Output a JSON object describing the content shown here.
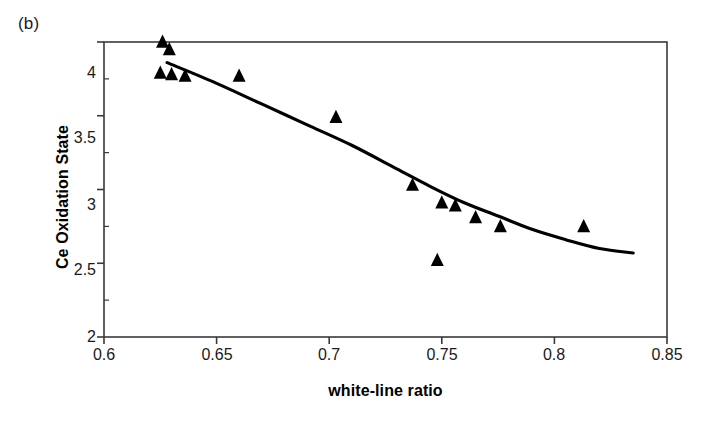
{
  "figure": {
    "panel_label": "(b)",
    "background_color": "#ffffff",
    "frame_color": "#1a1a1a",
    "marker_color": "#000000",
    "curve_color": "#000000"
  },
  "chart_data": {
    "type": "scatter",
    "title": "",
    "panel": "(b)",
    "xlabel": "white-line ratio",
    "ylabel": "Ce Oxidation State",
    "xlim": [
      0.6,
      0.85
    ],
    "ylim": [
      2,
      4
    ],
    "xticks": [
      0.6,
      0.65,
      0.7,
      0.75,
      0.8,
      0.85
    ],
    "xtick_labels": [
      "0.6",
      "0.65",
      "0.7",
      "0.75",
      "0.8",
      "0.85"
    ],
    "yticks": [
      2,
      2.5,
      3,
      3.5,
      4
    ],
    "ytick_labels": [
      "2",
      "2.5",
      "3",
      "3.5",
      "4"
    ],
    "grid": false,
    "legend": null,
    "marker": "filled-triangle-up",
    "series": [
      {
        "name": "Ce oxidation state vs white-line ratio",
        "points": [
          {
            "x": 0.626,
            "y": 4.0
          },
          {
            "x": 0.629,
            "y": 3.95
          },
          {
            "x": 0.625,
            "y": 3.79
          },
          {
            "x": 0.63,
            "y": 3.78
          },
          {
            "x": 0.636,
            "y": 3.77
          },
          {
            "x": 0.66,
            "y": 3.77
          },
          {
            "x": 0.703,
            "y": 3.49
          },
          {
            "x": 0.737,
            "y": 3.03
          },
          {
            "x": 0.75,
            "y": 2.91
          },
          {
            "x": 0.756,
            "y": 2.89
          },
          {
            "x": 0.748,
            "y": 2.52
          },
          {
            "x": 0.765,
            "y": 2.81
          },
          {
            "x": 0.776,
            "y": 2.75
          },
          {
            "x": 0.813,
            "y": 2.75
          }
        ]
      }
    ],
    "fit_curve": {
      "name": "trend line",
      "style": "solid",
      "points": [
        {
          "x": 0.628,
          "y": 3.86
        },
        {
          "x": 0.65,
          "y": 3.72
        },
        {
          "x": 0.67,
          "y": 3.58
        },
        {
          "x": 0.69,
          "y": 3.44
        },
        {
          "x": 0.71,
          "y": 3.3
        },
        {
          "x": 0.73,
          "y": 3.14
        },
        {
          "x": 0.745,
          "y": 3.02
        },
        {
          "x": 0.76,
          "y": 2.91
        },
        {
          "x": 0.775,
          "y": 2.82
        },
        {
          "x": 0.79,
          "y": 2.73
        },
        {
          "x": 0.805,
          "y": 2.66
        },
        {
          "x": 0.82,
          "y": 2.6
        },
        {
          "x": 0.835,
          "y": 2.57
        }
      ]
    }
  }
}
